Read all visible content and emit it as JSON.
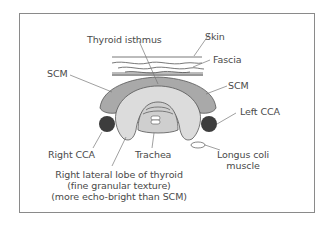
{
  "diagram": {
    "labels": {
      "thyroid_isthmus": "Thyroid isthmus",
      "skin": "Skin",
      "fascia": "Fascia",
      "scm_left_side": "SCM",
      "scm_right_side": "SCM",
      "left_cca": "Left CCA",
      "right_cca": "Right CCA",
      "trachea": "Trachea",
      "longus_coli_line1": "Longus coli",
      "longus_coli_line2": "muscle",
      "right_lobe_line1": "Right lateral lobe of thyroid",
      "right_lobe_line2": "(fine granular texture)",
      "right_lobe_line3": "(more echo-bright than SCM)"
    },
    "colors": {
      "scm": "#a9a9a9",
      "thyroid": "#dcdcdc",
      "trachea": "#cfcfcf",
      "cca": "#3d3d3d",
      "outline": "#555555",
      "text": "#4a4a4a",
      "frame": "#8a8a8a"
    }
  }
}
